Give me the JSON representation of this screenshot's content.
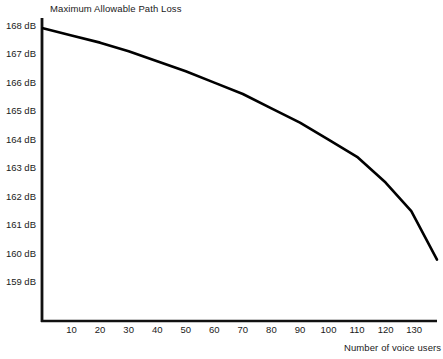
{
  "chart_data": {
    "type": "line",
    "title": "Maximum Allowable Path Loss",
    "xlabel": "Number of voice users",
    "ylabel": "",
    "xlim": [
      0,
      138
    ],
    "ylim": [
      158.6,
      168.2
    ],
    "grid": false,
    "legend": null,
    "x_ticks": [
      10,
      20,
      30,
      40,
      50,
      60,
      70,
      80,
      90,
      100,
      110,
      120,
      130
    ],
    "x_tick_labels": [
      "10",
      "20",
      "30",
      "40",
      "50",
      "60",
      "70",
      "80",
      "90",
      "100",
      "110",
      "120",
      "130"
    ],
    "y_ticks": [
      159,
      160,
      161,
      162,
      163,
      164,
      165,
      166,
      167,
      168
    ],
    "y_tick_labels": [
      "159 dB",
      "160 dB",
      "161 dB",
      "162 dB",
      "163 dB",
      "164 dB",
      "165 dB",
      "166 dB",
      "167 dB",
      "168 dB"
    ],
    "series": [
      {
        "name": "Maximum Allowable Path Loss",
        "color": "#000000",
        "line_width": 2.6,
        "x": [
          0,
          10,
          20,
          30,
          40,
          50,
          60,
          70,
          80,
          90,
          100,
          110,
          120,
          129,
          138
        ],
        "values": [
          167.9,
          167.65,
          167.4,
          167.1,
          166.75,
          166.4,
          166.0,
          165.6,
          165.1,
          164.6,
          164.0,
          163.4,
          162.5,
          161.5,
          159.8
        ]
      }
    ]
  },
  "axes": {
    "y_axis_color": "#111111",
    "x_axis_color": "#111111",
    "axis_line_width": 2.6
  }
}
